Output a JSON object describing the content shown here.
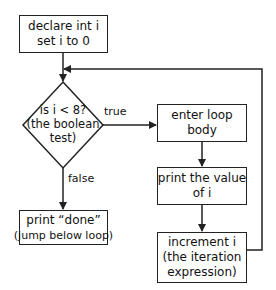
{
  "diagram": {
    "type": "flowchart",
    "nodes": {
      "init": {
        "line1": "declare int i",
        "line2": "set i to 0"
      },
      "test": {
        "line1": "is i < 8?",
        "line2": "(the boolean",
        "line3": "test)"
      },
      "body": {
        "line1": "enter loop",
        "line2": "body"
      },
      "print_value": {
        "line1": "print the value",
        "line2": "of i"
      },
      "increment": {
        "line1": "increment i",
        "line2": "(the iteration",
        "line3": "expression)"
      },
      "done": {
        "line1": "print “done”",
        "line2": "(jump below loop)"
      }
    },
    "edge_labels": {
      "true": "true",
      "false": "false"
    },
    "edges": [
      {
        "from": "init",
        "to": "test"
      },
      {
        "from": "test",
        "to": "body",
        "label": "true"
      },
      {
        "from": "test",
        "to": "done",
        "label": "false"
      },
      {
        "from": "body",
        "to": "print_value"
      },
      {
        "from": "print_value",
        "to": "increment"
      },
      {
        "from": "increment",
        "to": "test",
        "note": "loops back above the test"
      }
    ],
    "colors": {
      "stroke": "#222222",
      "background": "#ffffff",
      "text": "#111111"
    }
  }
}
